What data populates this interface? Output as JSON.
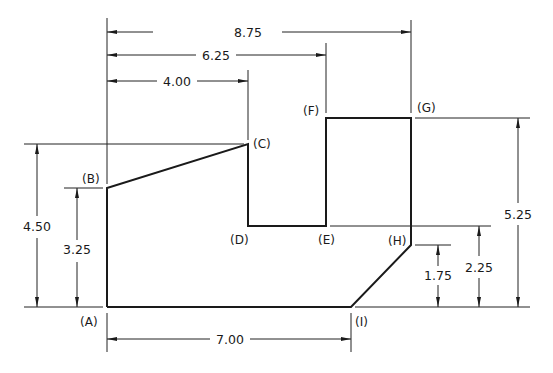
{
  "figure": {
    "type": "dimensioned-part-outline",
    "units": "in",
    "points": [
      {
        "id": "A",
        "label": "(A)",
        "x": 0.0,
        "y": 0.0
      },
      {
        "id": "B",
        "label": "(B)",
        "x": 0.0,
        "y": 3.25
      },
      {
        "id": "C",
        "label": "(C)",
        "x": 4.0,
        "y": 4.5
      },
      {
        "id": "D",
        "label": "(D)",
        "x": 4.0,
        "y": 2.25
      },
      {
        "id": "E",
        "label": "(E)",
        "x": 6.25,
        "y": 2.25
      },
      {
        "id": "F",
        "label": "(F)",
        "x": 6.25,
        "y": 5.25
      },
      {
        "id": "G",
        "label": "(G)",
        "x": 8.75,
        "y": 5.25
      },
      {
        "id": "H",
        "label": "(H)",
        "x": 8.75,
        "y": 1.75
      },
      {
        "id": "I",
        "label": "(I)",
        "x": 7.0,
        "y": 0.0
      }
    ],
    "labels": {
      "A": "(A)",
      "B": "(B)",
      "C": "(C)",
      "D": "(D)",
      "E": "(E)",
      "F": "(F)",
      "G": "(G)",
      "H": "(H)",
      "I": "(I)"
    },
    "dimensions": {
      "top_overall": "8.75",
      "top_mid": "6.25",
      "top_short": "4.00",
      "bottom": "7.00",
      "left_outer": "4.50",
      "left_inner": "3.25",
      "right_small": "1.75",
      "right_mid": "2.25",
      "right_outer": "5.25"
    }
  }
}
